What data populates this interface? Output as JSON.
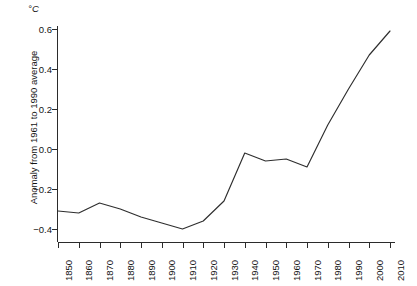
{
  "chart_data": {
    "type": "line",
    "title": "",
    "subtitle": "",
    "unit_label": "°C",
    "xlabel": "",
    "ylabel": "Anomaly from 1961 to 1990 average",
    "xlim": [
      1850,
      2010
    ],
    "ylim": [
      -0.45,
      0.62
    ],
    "yticks": [
      -0.4,
      -0.2,
      0.0,
      0.2,
      0.4,
      0.6
    ],
    "ytick_labels": [
      "−0.4",
      "−0.2",
      "0.0",
      "0.2",
      "0.4",
      "0.6"
    ],
    "xticks": [
      1850,
      1860,
      1870,
      1880,
      1890,
      1900,
      1910,
      1920,
      1930,
      1940,
      1950,
      1960,
      1970,
      1980,
      1990,
      2000,
      2010
    ],
    "xtick_labels": [
      "1850",
      "1860",
      "1870",
      "1880",
      "1890",
      "1900",
      "1910",
      "1920",
      "1930",
      "1940",
      "1950",
      "1960",
      "1970",
      "1980",
      "1990",
      "2000",
      "2010"
    ],
    "grid": false,
    "legend": false,
    "legend_position": "none",
    "series": [
      {
        "name": "Global temperature anomaly",
        "color": "#2e2e2e",
        "x": [
          1850,
          1860,
          1870,
          1880,
          1890,
          1900,
          1910,
          1920,
          1930,
          1940,
          1950,
          1960,
          1970,
          1980,
          1990,
          2000,
          2010
        ],
        "values": [
          -0.31,
          -0.32,
          -0.27,
          -0.3,
          -0.34,
          -0.37,
          -0.4,
          -0.36,
          -0.26,
          -0.02,
          -0.06,
          -0.05,
          -0.09,
          0.12,
          0.3,
          0.47,
          0.59
        ]
      }
    ]
  }
}
